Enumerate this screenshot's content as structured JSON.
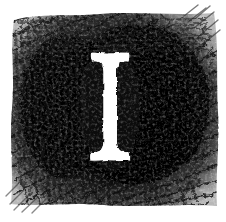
{
  "image": {
    "kind": "decorative-drop-cap",
    "description": "Scanned hand-drawn charcoal/woodcut illuminated initial: a white serif capital letter on a scratchy black square block",
    "width": 226,
    "height": 222,
    "background_color": "#ffffff",
    "technique": "charcoal / crayon scratchy hatching"
  },
  "initial": {
    "letter": "I",
    "letter_color": "#ffffff",
    "style": "roman-serif-capital",
    "serifs": "flared bracketed",
    "stem_center_x": 110,
    "stem_width": 14,
    "cap_top_y": 52,
    "cap_bottom_y": 160,
    "serif_half_width": 19
  },
  "block": {
    "ink_color": "#0a0a0a",
    "mid_tone_color": "#3a3a3a",
    "light_tone_color": "#777777",
    "left_x": 12,
    "right_x": 218,
    "top_y": 15,
    "bottom_y": 205
  },
  "hatching": {
    "primary_direction": "diagonal",
    "edge_texture": "ragged feathered strokes",
    "density_label": "dense-core-soft-edges"
  }
}
